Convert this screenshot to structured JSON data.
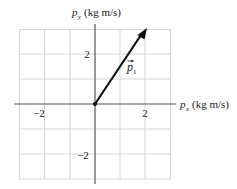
{
  "diagram": {
    "type": "vector-plot",
    "x_axis_label": "(kg m/s)",
    "x_axis_symbol": "p",
    "x_axis_subscript": "x",
    "y_axis_label": "(kg m/s)",
    "y_axis_symbol": "p",
    "y_axis_subscript": "y",
    "x_ticks": [
      {
        "value": -2,
        "label": "−2"
      },
      {
        "value": 2,
        "label": "2"
      }
    ],
    "y_ticks": [
      {
        "value": 2,
        "label": "2"
      },
      {
        "value": -2,
        "label": "−2"
      }
    ],
    "grid_range": {
      "x": [
        -3,
        3
      ],
      "y": [
        -3,
        3
      ]
    },
    "vector": {
      "name": "p1",
      "symbol": "p",
      "subscript": "1",
      "from": [
        0,
        0
      ],
      "to": [
        2,
        3
      ]
    },
    "colors": {
      "grid": "#d6d6d6",
      "axis": "#555555",
      "vector": "#111111"
    }
  }
}
